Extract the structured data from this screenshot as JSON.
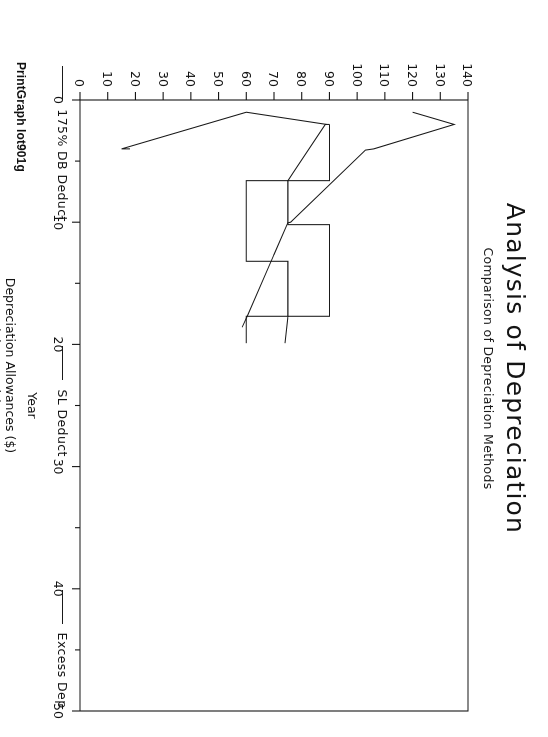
{
  "document": {
    "title": "Analysis of Depreciation",
    "subtitle": "Comparison of Depreciation Methods",
    "footer": "PrintGraph lot901g"
  },
  "chart_data": {
    "type": "line",
    "title": "Analysis of Depreciation",
    "subtitle": "Comparison of Depreciation Methods",
    "xlabel": "Year",
    "ylabel_line1": "Depreciation Allowances ($)",
    "ylabel_line2": "(Thousands)",
    "xlim": [
      0,
      50
    ],
    "ylim": [
      0,
      140
    ],
    "xticks": [
      0,
      10,
      20,
      30,
      40,
      50
    ],
    "xticks_minor": [
      5,
      15,
      25,
      35,
      45
    ],
    "xticklabels": [
      "0",
      "10",
      "20",
      "30",
      "40",
      "50"
    ],
    "yticks": [
      0,
      10,
      20,
      30,
      40,
      50,
      60,
      70,
      80,
      90,
      100,
      110,
      120,
      130,
      140
    ],
    "yticklabels": [
      "0",
      "10",
      "20",
      "30",
      "40",
      "50",
      "60",
      "70",
      "80",
      "90",
      "100",
      "110",
      "120",
      "130",
      "140"
    ],
    "grid": false,
    "legend_position": "bottom",
    "series": [
      {
        "name": "175% DB Deduct",
        "color": "#1a1a1a",
        "points": [
          [
            1.0,
            120.0
          ],
          [
            2.0,
            135.0
          ],
          [
            4.0,
            106.0
          ],
          [
            4.1,
            103.0
          ],
          [
            10.0,
            76.0
          ],
          [
            10.05,
            75.0
          ],
          [
            17.6,
            60.5
          ],
          [
            18.6,
            58.5
          ]
        ]
      },
      {
        "name": "SL Deduct",
        "color": "#1a1a1a",
        "points": [
          [
            2.0,
            90.0
          ],
          [
            6.6,
            90.0
          ],
          [
            6.6,
            75.0
          ],
          [
            10.2,
            75.0
          ],
          [
            10.2,
            90.0
          ],
          [
            17.7,
            90.0
          ],
          [
            17.7,
            75.0
          ],
          [
            19.9,
            74.0
          ]
        ]
      },
      {
        "name": "Excess Dep",
        "color": "#1a1a1a",
        "points": [
          [
            2.0,
            90.0
          ],
          [
            2.0,
            88.5
          ],
          [
            6.6,
            75.0
          ],
          [
            6.6,
            60.0
          ],
          [
            13.2,
            60.0
          ],
          [
            13.2,
            75.0
          ],
          [
            17.7,
            75.0
          ],
          [
            17.7,
            60.0
          ],
          [
            19.9,
            60.0
          ]
        ]
      },
      {
        "name": "Excess Dep lower",
        "color": "#1a1a1a",
        "points": [
          [
            2.0,
            89.0
          ],
          [
            1.0,
            60.0
          ],
          [
            4.0,
            15.0
          ],
          [
            4.0,
            18.0
          ]
        ]
      }
    ],
    "legend": [
      {
        "label": "175% DB Deduct",
        "color": "#1a1a1a",
        "marker": "line"
      },
      {
        "label": "SL Deduct",
        "color": "#1a1a1a",
        "marker": "line"
      },
      {
        "label": "Excess Dep",
        "color": "#1a1a1a",
        "marker": "line"
      }
    ]
  }
}
